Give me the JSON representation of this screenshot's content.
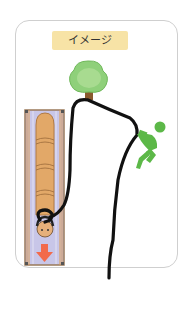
{
  "card": {
    "label": "イメージ"
  },
  "illustration": {
    "description": "Rope tied to a tree, passing around a person's head in a roll-mat/pipe, held by a green figure",
    "colors": {
      "label_bg": "#f7e3a6",
      "tree_foliage": "#8fd07a",
      "tree_trunk": "#8a5a2e",
      "figure": "#5cb848",
      "rope": "#111111",
      "panel_bg": "#c9c7e6",
      "pipe": "#e0a868",
      "arrow": "#f26a4b"
    },
    "icons": [
      "tree-icon",
      "person-figure-icon",
      "down-arrow-icon"
    ]
  }
}
